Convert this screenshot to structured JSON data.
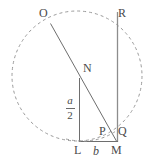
{
  "figure": {
    "colors": {
      "stroke": "#6e6e6e",
      "dashed_stroke": "#9a9a9a",
      "label_text": "#4a4a4a",
      "background": "#ffffff"
    },
    "circle": {
      "center_x": 77,
      "center_y": 76,
      "radius": 65,
      "style": "dashed"
    },
    "points": [
      {
        "id": "O",
        "label": "O",
        "x": 50,
        "y": 22
      },
      {
        "id": "R",
        "label": "R",
        "x": 118,
        "y": 13
      },
      {
        "id": "N",
        "label": "N",
        "x": 79,
        "y": 77
      },
      {
        "id": "P",
        "label": "P",
        "x": 108,
        "y": 133
      },
      {
        "id": "Q",
        "label": "Q",
        "x": 118,
        "y": 133
      },
      {
        "id": "L",
        "label": "L",
        "x": 79,
        "y": 142
      },
      {
        "id": "M",
        "label": "M",
        "x": 118,
        "y": 142
      }
    ],
    "segments": [
      {
        "id": "OM",
        "from": "O",
        "to": "M"
      },
      {
        "id": "LN",
        "from": "L",
        "to": "N"
      },
      {
        "id": "RM",
        "from": "R",
        "to": "M"
      },
      {
        "id": "LM",
        "from": "L",
        "to": "M"
      }
    ],
    "arcs": [
      {
        "id": "arc-LQ",
        "from": "L",
        "to": "Q",
        "style": "dashed"
      }
    ],
    "labels": {
      "O": "O",
      "R": "R",
      "N": "N",
      "P": "P",
      "Q": "Q",
      "L": "L",
      "M": "M",
      "b": "b",
      "a_over_2_numerator": "a",
      "a_over_2_denominator": "2"
    }
  }
}
